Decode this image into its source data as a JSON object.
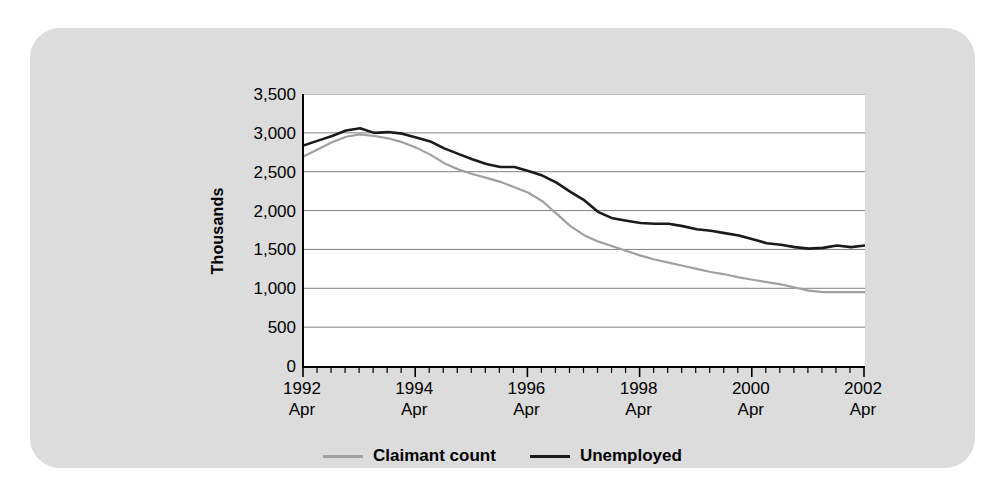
{
  "chart_data": {
    "type": "line",
    "title": "",
    "xlabel": "",
    "ylabel": "Thousands",
    "ylim": [
      0,
      3500
    ],
    "ytick_labels": [
      "3,500",
      "3,000",
      "2,500",
      "2,000",
      "1,500",
      "1,000",
      "500",
      "0"
    ],
    "ytick_values": [
      3500,
      3000,
      2500,
      2000,
      1500,
      1000,
      500,
      0
    ],
    "grid": true,
    "grid_axis": "y",
    "legend_position": "bottom-center",
    "x_start": "1992 Apr",
    "x_end": "2002 Apr",
    "x_tick_interval_quarters": 1,
    "x_labels": [
      {
        "year": "1992",
        "month": "Apr"
      },
      {
        "year": "1994",
        "month": "Apr"
      },
      {
        "year": "1996",
        "month": "Apr"
      },
      {
        "year": "1998",
        "month": "Apr"
      },
      {
        "year": "2000",
        "month": "Apr"
      },
      {
        "year": "2002",
        "month": "Apr"
      }
    ],
    "x_quarters": [
      "1992 Apr",
      "1992 Jul",
      "1992 Oct",
      "1993 Jan",
      "1993 Apr",
      "1993 Jul",
      "1993 Oct",
      "1994 Jan",
      "1994 Apr",
      "1994 Jul",
      "1994 Oct",
      "1995 Jan",
      "1995 Apr",
      "1995 Jul",
      "1995 Oct",
      "1996 Jan",
      "1996 Apr",
      "1996 Jul",
      "1996 Oct",
      "1997 Jan",
      "1997 Apr",
      "1997 Jul",
      "1997 Oct",
      "1998 Jan",
      "1998 Apr",
      "1998 Jul",
      "1998 Oct",
      "1999 Jan",
      "1999 Apr",
      "1999 Jul",
      "1999 Oct",
      "2000 Jan",
      "2000 Apr",
      "2000 Jul",
      "2000 Oct",
      "2001 Jan",
      "2001 Apr",
      "2001 Jul",
      "2001 Oct",
      "2002 Jan",
      "2002 Apr"
    ],
    "series": [
      {
        "name": "Claimant count",
        "color": "#a0a0a0",
        "values": [
          2700,
          2790,
          2880,
          2950,
          2980,
          2960,
          2930,
          2880,
          2810,
          2720,
          2610,
          2530,
          2470,
          2420,
          2370,
          2300,
          2230,
          2120,
          1960,
          1800,
          1680,
          1600,
          1540,
          1480,
          1420,
          1370,
          1330,
          1290,
          1250,
          1210,
          1180,
          1140,
          1110,
          1080,
          1050,
          1010,
          970,
          950,
          950,
          950,
          950
        ]
      },
      {
        "name": "Unemployed",
        "color": "#1a1a1a",
        "values": [
          2840,
          2900,
          2960,
          3030,
          3060,
          3000,
          3010,
          2990,
          2940,
          2890,
          2800,
          2730,
          2660,
          2600,
          2560,
          2560,
          2510,
          2450,
          2360,
          2240,
          2130,
          1980,
          1900,
          1870,
          1840,
          1830,
          1830,
          1800,
          1760,
          1740,
          1710,
          1680,
          1630,
          1580,
          1560,
          1530,
          1510,
          1520,
          1550,
          1530,
          1550
        ]
      }
    ]
  },
  "legend": {
    "items": [
      {
        "label": "Claimant count",
        "key": "claimant"
      },
      {
        "label": "Unemployed",
        "key": "unemployed"
      }
    ]
  },
  "axis": {
    "y_title": "Thousands"
  }
}
